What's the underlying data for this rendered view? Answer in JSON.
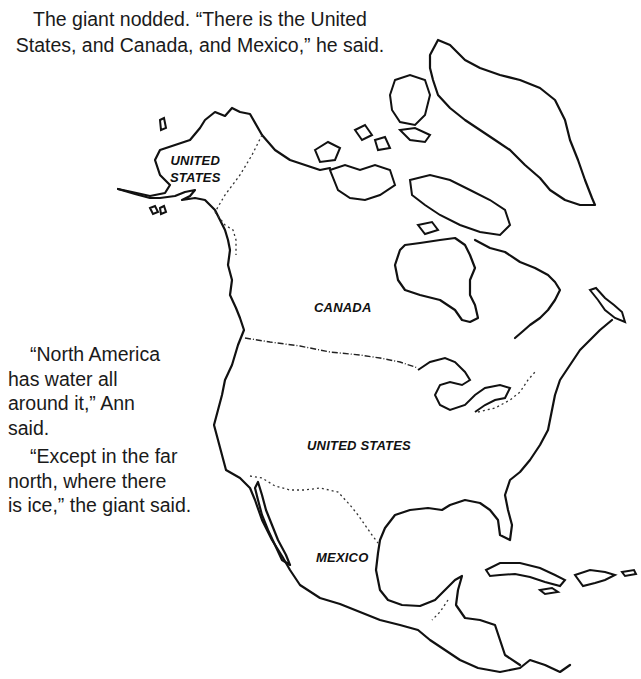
{
  "caption_top": {
    "line1": "The giant nodded. “There is the United",
    "line2": "States, and Canada, and Mexico,” he said."
  },
  "side_text": {
    "para1_line1": "“North America",
    "para1_line2": "has water all",
    "para1_line3": "around it,” Ann",
    "para1_line4": "said.",
    "para2_line1": "“Except in the far",
    "para2_line2": "north, where there",
    "para2_line3": "is ice,” the giant said."
  },
  "map": {
    "title": "North America outline map",
    "labels": {
      "alaska_line1": "UNITED",
      "alaska_line2": "STATES",
      "canada": "CANADA",
      "united_states": "UNITED STATES",
      "mexico": "MEXICO"
    },
    "colors": {
      "ink": "#111111",
      "paper": "#ffffff"
    }
  }
}
